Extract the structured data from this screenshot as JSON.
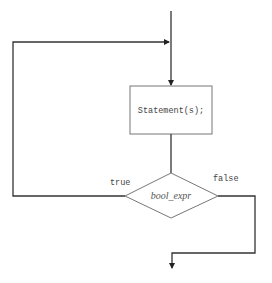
{
  "diagram": {
    "type": "flowchart",
    "nodes": {
      "statement": {
        "label": "Statement(s);",
        "shape": "rectangle"
      },
      "condition": {
        "label": "bool_expr",
        "shape": "diamond"
      }
    },
    "edges": {
      "true_label": "true",
      "false_label": "false"
    },
    "colors": {
      "line": "#333333",
      "shape_stroke": "#777777",
      "text": "#444444"
    }
  }
}
